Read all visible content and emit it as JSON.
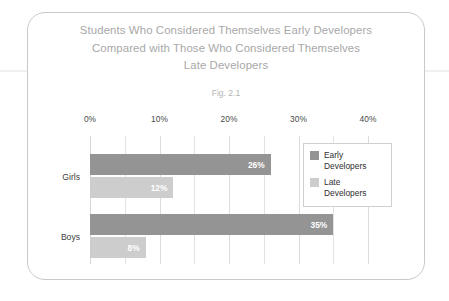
{
  "figure": {
    "title_lines": [
      "Students Who Considered Themselves Early Developers",
      "Compared with Those Who Considered Themselves",
      "Late Developers"
    ],
    "caption": "Fig. 2.1"
  },
  "chart_data": {
    "type": "bar",
    "orientation": "horizontal",
    "title": "Students Who Considered Themselves Early Developers Compared with Those Who Considered Themselves Late Developers",
    "subtitle": "Fig. 2.1",
    "xlabel": "",
    "ylabel": "",
    "categories": [
      "Girls",
      "Boys"
    ],
    "series": [
      {
        "name": "Early Developers",
        "name_lines": "Early\nDevelopers",
        "color": "#949494",
        "values": [
          26,
          35
        ],
        "value_labels": [
          "26%",
          "8%"
        ]
      },
      {
        "name": "Late Developers",
        "name_lines": "Late\nDevelopers",
        "color": "#cdcdcd",
        "values": [
          12,
          8
        ],
        "value_labels": [
          "12%",
          "8%"
        ]
      }
    ],
    "bars": [
      {
        "category": "Girls",
        "series": "Early Developers",
        "value": 26,
        "label": "26%"
      },
      {
        "category": "Girls",
        "series": "Late Developers",
        "value": 12,
        "label": "12%"
      },
      {
        "category": "Boys",
        "series": "Early Developers",
        "value": 35,
        "label": "35%"
      },
      {
        "category": "Boys",
        "series": "Late Developers",
        "value": 8,
        "label": "8%"
      }
    ],
    "xlim": [
      0,
      40
    ],
    "xtick_labels": [
      "0%",
      "10%",
      "20%",
      "30%",
      "40%"
    ],
    "xtick_values": [
      0,
      10,
      20,
      30,
      40
    ],
    "minor_gridline_values": [
      5,
      15,
      25,
      35
    ],
    "grid": true,
    "legend_position": "center-right",
    "legend_entries": [
      "Early Developers",
      "Late Developers"
    ]
  }
}
